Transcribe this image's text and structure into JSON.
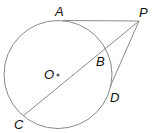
{
  "diagram": {
    "type": "geometry",
    "stroke_color": "#8a8a8a",
    "label_color": "#111111",
    "circle": {
      "center_label": "O"
    },
    "points": {
      "A": {
        "label": "A"
      },
      "B": {
        "label": "B"
      },
      "C": {
        "label": "C"
      },
      "D": {
        "label": "D"
      },
      "P": {
        "label": "P"
      },
      "O": {
        "label": "O"
      }
    },
    "segments": [
      "PA",
      "PC",
      "PD"
    ]
  }
}
